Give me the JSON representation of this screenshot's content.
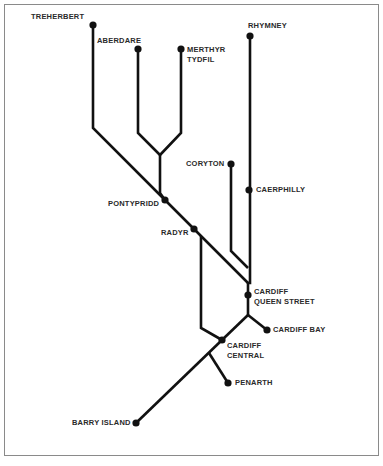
{
  "diagram": {
    "type": "rail-network-schematic",
    "line_color": "#111111",
    "station_color": "#111111",
    "stations": [
      {
        "id": "treherbert",
        "label": "TREHERBERT",
        "x": 93,
        "y": 25
      },
      {
        "id": "aberdare",
        "label": "ABERDARE",
        "x": 138,
        "y": 49
      },
      {
        "id": "merthyr",
        "label": "MERTHYR TYDFIL",
        "line1": "MERTHYR",
        "line2": "TYDFIL",
        "x": 181,
        "y": 49
      },
      {
        "id": "rhymney",
        "label": "RHYMNEY",
        "x": 250,
        "y": 36
      },
      {
        "id": "coryton",
        "label": "CORYTON",
        "x": 231,
        "y": 164
      },
      {
        "id": "caerphilly",
        "label": "CAERPHILLY",
        "x": 249,
        "y": 190
      },
      {
        "id": "pontypridd",
        "label": "PONTYPRIDD",
        "x": 165,
        "y": 200
      },
      {
        "id": "radyr",
        "label": "RADYR",
        "x": 194,
        "y": 229
      },
      {
        "id": "cardiff-queen-street",
        "label": "CARDIFF QUEEN STREET",
        "line1": "CARDIFF",
        "line2": "QUEEN STREET",
        "x": 248,
        "y": 295
      },
      {
        "id": "cardiff-bay",
        "label": "CARDIFF BAY",
        "x": 267,
        "y": 330
      },
      {
        "id": "cardiff-central",
        "label": "CARDIFF CENTRAL",
        "line1": "CARDIFF",
        "line2": "CENTRAL",
        "x": 222,
        "y": 340
      },
      {
        "id": "penarth",
        "label": "PENARTH",
        "x": 228,
        "y": 383
      },
      {
        "id": "barry-island",
        "label": "BARRY ISLAND",
        "x": 136,
        "y": 423
      }
    ],
    "routes": [
      {
        "id": "treherbert-line",
        "points": "93,25 93,128 165,200"
      },
      {
        "id": "aberdare-line",
        "points": "138,49 138,133 160,155"
      },
      {
        "id": "merthyr-line",
        "points": "181,49 181,133 160,155"
      },
      {
        "id": "valleys-trunk",
        "points": "160,155 160,193 165,200"
      },
      {
        "id": "main-diagonal",
        "points": "165,200 194,229 248,283"
      },
      {
        "id": "rhymney-line",
        "points": "250,36 250,283 248,283 248,315"
      },
      {
        "id": "coryton-line",
        "points": "231,164 231,251 248,268"
      },
      {
        "id": "radyr-city-line",
        "points": "201,236 201,328 222,340"
      },
      {
        "id": "queen-st-to-central",
        "points": "248,315 222,340"
      },
      {
        "id": "cardiff-bay-branch",
        "points": "248,315 267,330"
      },
      {
        "id": "barry-line",
        "points": "222,340 136,423"
      },
      {
        "id": "penarth-branch",
        "points": "209,353 228,383"
      }
    ]
  },
  "labels": {
    "treherbert": "TREHERBERT",
    "aberdare": "ABERDARE",
    "merthyr_1": "MERTHYR",
    "merthyr_2": "TYDFIL",
    "rhymney": "RHYMNEY",
    "coryton": "CORYTON",
    "caerphilly": "CAERPHILLY",
    "pontypridd": "PONTYPRIDD",
    "radyr": "RADYR",
    "queen_street_1": "CARDIFF",
    "queen_street_2": "QUEEN STREET",
    "cardiff_bay": "CARDIFF BAY",
    "central_1": "CARDIFF",
    "central_2": "CENTRAL",
    "penarth": "PENARTH",
    "barry_island": "BARRY ISLAND"
  },
  "caption": {
    "visible": "truncated-illegible"
  }
}
